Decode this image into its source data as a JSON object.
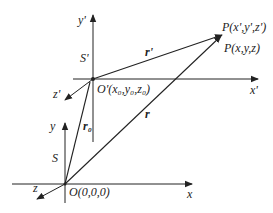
{
  "diagram": {
    "frames": {
      "moving": {
        "name": "S'",
        "origin": "O'(x₀,y₀,z₀)",
        "axes": {
          "x": "x'",
          "y": "y'",
          "z": "z'"
        }
      },
      "fixed": {
        "name": "S",
        "origin": "O(0,0,0)",
        "axes": {
          "x": "x",
          "y": "y",
          "z": "z"
        }
      }
    },
    "point": {
      "primed": "P(x',y',z')",
      "unprimed": "P(x,y,z)"
    },
    "vectors": {
      "r_prime": "r'",
      "r": "r",
      "r0": "r₀"
    },
    "colors": {
      "line": "#222222",
      "background": "#ffffff"
    }
  }
}
